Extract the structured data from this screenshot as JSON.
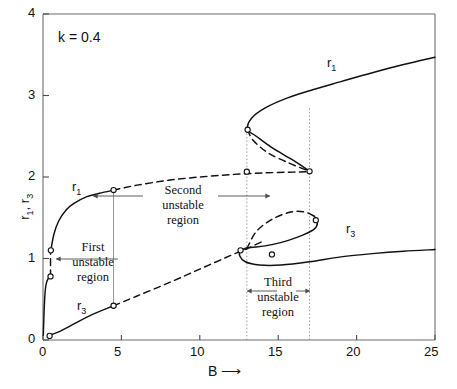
{
  "chart_data": {
    "type": "line",
    "title": "",
    "xlabel": "B",
    "ylabel": "r1, r3",
    "xlim": [
      0,
      25
    ],
    "ylim": [
      0,
      4
    ],
    "grid": false,
    "legend_position": "inline-curve-labels",
    "annotations": [
      {
        "name": "parameter",
        "text": "k = 0.4",
        "x": 1.5,
        "y": 3.62
      },
      {
        "name": "first-unstable-region",
        "lines": [
          "First",
          "unstable",
          "region"
        ],
        "x": 2.6,
        "y": 1.05
      },
      {
        "name": "second-unstable-region",
        "lines": [
          "Second",
          "unstable",
          "region"
        ],
        "x": 8.9,
        "y": 1.72
      },
      {
        "name": "third-unstable-region",
        "lines": [
          "Third",
          "unstable",
          "region"
        ],
        "x": 15.0,
        "y": 0.38
      }
    ],
    "curve_labels": [
      {
        "name": "r1-left",
        "text": "r1",
        "x": 2.6,
        "y": 1.84
      },
      {
        "name": "r1-right",
        "text": "r1",
        "x": 18.1,
        "y": 3.28
      },
      {
        "name": "r3-left",
        "text": "r3",
        "x": 3.0,
        "y": 0.45
      },
      {
        "name": "r3-right",
        "text": "r3",
        "x": 20.0,
        "y": 1.17
      }
    ],
    "x_ticks": [
      0,
      5,
      10,
      15,
      20,
      25
    ],
    "y_ticks": [
      0,
      1,
      2,
      3,
      4
    ],
    "vertical_marker_lines": [
      {
        "name": "marker-b-4p5",
        "x": 4.5,
        "y0": 0.42,
        "y1": 1.84,
        "style": "solid-thin"
      },
      {
        "name": "marker-b-13",
        "x": 13.0,
        "y0": 0.0,
        "y1": 2.58,
        "style": "dotted"
      },
      {
        "name": "marker-b-17",
        "x": 17.0,
        "y0": 0.0,
        "y1": 2.85,
        "style": "dotted"
      }
    ],
    "series": [
      {
        "name": "r1-stable-lower-left",
        "style": "solid",
        "points": [
          [
            0.02,
            0.06
          ],
          [
            0.06,
            0.3
          ],
          [
            0.1,
            0.48
          ],
          [
            0.15,
            0.62
          ],
          [
            0.22,
            0.7
          ],
          [
            0.32,
            0.75
          ],
          [
            0.45,
            0.78
          ]
        ]
      },
      {
        "name": "r1-unstable-first-region",
        "style": "dashed",
        "points": [
          [
            0.48,
            0.78
          ],
          [
            0.48,
            1.1
          ]
        ]
      },
      {
        "name": "r1-stable-upper-left",
        "style": "solid",
        "points": [
          [
            0.5,
            1.1
          ],
          [
            0.7,
            1.3
          ],
          [
            1.0,
            1.46
          ],
          [
            1.5,
            1.6
          ],
          [
            2.0,
            1.68
          ],
          [
            2.8,
            1.76
          ],
          [
            3.6,
            1.8
          ],
          [
            4.5,
            1.84
          ]
        ]
      },
      {
        "name": "r1-unstable-second-region",
        "style": "dashed",
        "points": [
          [
            4.5,
            1.84
          ],
          [
            6,
            1.9
          ],
          [
            8,
            1.96
          ],
          [
            10,
            2.0
          ],
          [
            12,
            2.03
          ],
          [
            14,
            2.05
          ],
          [
            16,
            2.06
          ],
          [
            16.9,
            2.065
          ]
        ]
      },
      {
        "name": "r1-upper-fold-branch",
        "style": "solid",
        "points": [
          [
            17.0,
            2.07
          ],
          [
            16.0,
            2.2
          ],
          [
            14.6,
            2.36
          ],
          [
            13.6,
            2.5
          ],
          [
            13.05,
            2.58
          ],
          [
            13.3,
            2.72
          ],
          [
            14.2,
            2.85
          ],
          [
            15.6,
            2.97
          ],
          [
            17.2,
            3.07
          ],
          [
            19,
            3.17
          ],
          [
            21,
            3.28
          ],
          [
            23,
            3.38
          ],
          [
            25,
            3.47
          ]
        ]
      },
      {
        "name": "r1-unstable-fold-dashed",
        "style": "dashed",
        "points": [
          [
            13.05,
            2.58
          ],
          [
            13.4,
            2.45
          ],
          [
            14.4,
            2.29
          ],
          [
            15.7,
            2.17
          ],
          [
            16.6,
            2.1
          ],
          [
            17.0,
            2.07
          ]
        ]
      },
      {
        "name": "r3-stable-lower-left",
        "style": "solid",
        "points": [
          [
            0.3,
            0.05
          ],
          [
            1.0,
            0.1
          ],
          [
            2.0,
            0.2
          ],
          [
            3.0,
            0.3
          ],
          [
            4.5,
            0.42
          ]
        ]
      },
      {
        "name": "r3-unstable-rising",
        "style": "dashed",
        "points": [
          [
            4.5,
            0.42
          ],
          [
            6,
            0.54
          ],
          [
            8,
            0.7
          ],
          [
            10,
            0.87
          ],
          [
            12,
            1.04
          ],
          [
            13,
            1.12
          ],
          [
            14,
            1.21
          ]
        ]
      },
      {
        "name": "r3-loop-upper-dashed",
        "style": "dashed",
        "points": [
          [
            13.0,
            1.12
          ],
          [
            13.6,
            1.33
          ],
          [
            14.6,
            1.48
          ],
          [
            15.8,
            1.57
          ],
          [
            16.7,
            1.57
          ],
          [
            17.3,
            1.52
          ]
        ]
      },
      {
        "name": "r3-loop-fold-right",
        "style": "solid",
        "points": [
          [
            17.3,
            1.52
          ],
          [
            17.5,
            1.44
          ],
          [
            17.3,
            1.36
          ],
          [
            16.6,
            1.29
          ],
          [
            15.6,
            1.22
          ],
          [
            14.6,
            1.17
          ],
          [
            13.6,
            1.14
          ],
          [
            13.0,
            1.13
          ]
        ]
      },
      {
        "name": "r3-loop-lower",
        "style": "solid",
        "points": [
          [
            13.0,
            1.13
          ],
          [
            12.6,
            1.1
          ],
          [
            12.55,
            1.03
          ],
          [
            12.9,
            0.96
          ],
          [
            13.8,
            0.92
          ],
          [
            15.2,
            0.92
          ],
          [
            17,
            0.96
          ],
          [
            19,
            1.02
          ],
          [
            21,
            1.06
          ],
          [
            23,
            1.09
          ],
          [
            25,
            1.11
          ]
        ]
      }
    ],
    "open_circle_markers": [
      {
        "name": "marker-origin",
        "x": 0.42,
        "y": 0.05
      },
      {
        "name": "marker-first-unstable-low",
        "x": 0.48,
        "y": 0.78
      },
      {
        "name": "marker-first-unstable-high",
        "x": 0.5,
        "y": 1.1
      },
      {
        "name": "marker-b45-r1",
        "x": 4.5,
        "y": 1.84
      },
      {
        "name": "marker-b45-r3",
        "x": 4.5,
        "y": 0.42
      },
      {
        "name": "marker-upper-fold",
        "x": 13.05,
        "y": 2.58
      },
      {
        "name": "marker-b13-upper",
        "x": 13.0,
        "y": 2.065
      },
      {
        "name": "marker-b17-upper",
        "x": 17.0,
        "y": 2.07
      },
      {
        "name": "marker-loop-left",
        "x": 12.6,
        "y": 1.1
      },
      {
        "name": "marker-loop-mid",
        "x": 14.6,
        "y": 1.05
      },
      {
        "name": "marker-loop-right",
        "x": 17.4,
        "y": 1.47
      }
    ]
  },
  "axis": {
    "x_label": "B",
    "x_arrow": "⟶",
    "y_label_prefix": "r",
    "y_label": "r1, r3"
  }
}
